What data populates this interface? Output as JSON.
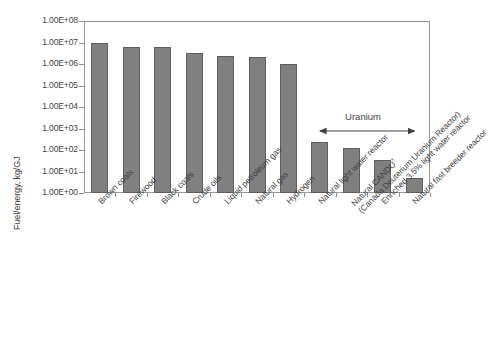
{
  "chart_data": {
    "type": "bar",
    "title": "",
    "xlabel": "",
    "ylabel": "Fuel/energy, kg/GJ",
    "scale": "log",
    "ylim": [
      1,
      100000000
    ],
    "ytick_labels": [
      "1.00E+08",
      "1.00E+07",
      "1.00E+06",
      "1.00E+05",
      "1.00E+04",
      "1.00E+03",
      "1.00E+02",
      "1.00E+01",
      "1.00E+00"
    ],
    "ytick_values": [
      100000000,
      10000000,
      1000000,
      100000,
      10000,
      1000,
      100,
      10,
      1
    ],
    "grid": false,
    "legend": "none",
    "categories": [
      "Brown coals",
      "Firewood",
      "Black coals",
      "Crude oils",
      "Liquid petroleum gas",
      "Natural gas",
      "Hydrogen",
      "Natural light water reactor",
      "Natural CANDU* (Canada Deuterium Uranium Reactor)",
      "Enriched 3.5% light water reactor",
      "Natural fast breeder reactor"
    ],
    "values": [
      10000000,
      6500000,
      6300000,
      3300000,
      2300000,
      2200000,
      1000000,
      240,
      130,
      35,
      5
    ],
    "bar_color": "#808080",
    "bar_edge_color": "#5e5e5e",
    "annotations": [
      {
        "text": "Uranium",
        "type": "double-headed-arrow-span",
        "spans_categories": [
          "Natural light water reactor",
          "Natural CANDU* (Canada Deuterium Uranium Reactor)",
          "Enriched 3.5% light water reactor",
          "Natural fast breeder reactor"
        ]
      }
    ]
  },
  "axis": {
    "y_title": "Fuel/energy, kg/GJ",
    "y_labels": [
      "1.00E+08",
      "1.00E+07",
      "1.00E+06",
      "1.00E+05",
      "1.00E+04",
      "1.00E+03",
      "1.00E+02",
      "1.00E+01",
      "1.00E+00"
    ],
    "x_labels": [
      {
        "line1": "Brown coals",
        "line2": "",
        "mark": ""
      },
      {
        "line1": "Firewood",
        "line2": "",
        "mark": ""
      },
      {
        "line1": "Black coals",
        "line2": "",
        "mark": ""
      },
      {
        "line1": "Crude oils",
        "line2": "",
        "mark": ""
      },
      {
        "line1": "Liquid petroleum gas",
        "line2": "",
        "mark": ""
      },
      {
        "line1": "Natural gas",
        "line2": "",
        "mark": ""
      },
      {
        "line1": "Hydrogen",
        "line2": "",
        "mark": ""
      },
      {
        "line1": "Natural light water reactor",
        "line2": "",
        "mark": ""
      },
      {
        "line1": "Natural CANDU",
        "line2": "(Canada Deuterium Uranium Reactor)",
        "mark": "*"
      },
      {
        "line1": "Enriched 3.5% light water reactor",
        "line2": "",
        "mark": ""
      },
      {
        "line1": "Natural fast breeder reactor",
        "line2": "",
        "mark": ""
      }
    ]
  },
  "annotation": {
    "uranium_label": "Uranium"
  },
  "colors": {
    "bar_fill": "#808080",
    "bar_edge": "#5e5e5e",
    "axis": "#9a9a9a",
    "text": "#3f3f3f"
  }
}
